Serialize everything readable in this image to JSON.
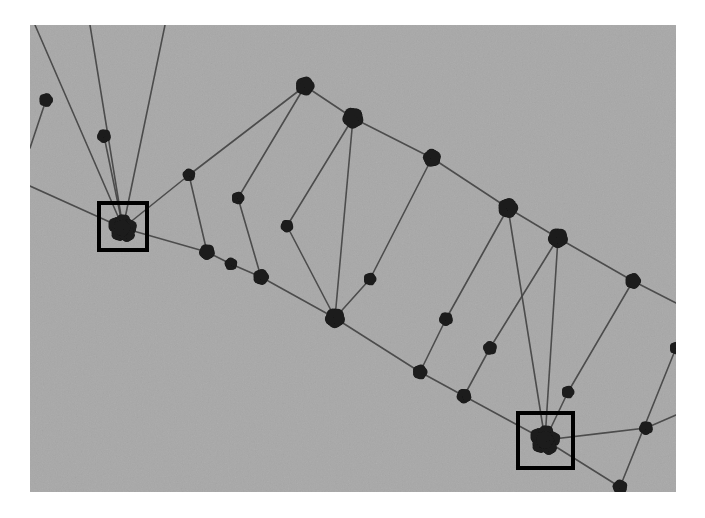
{
  "figure": {
    "domain": "diagram",
    "kind": "graph-network-diagram",
    "background_color": "#ffffff",
    "canvas_color": "#a8a8a8",
    "node_color": "#1b1b1b",
    "edge_color": "#454545",
    "box_color": "#000000",
    "canvas": {
      "x": 30,
      "y": 25,
      "width": 646,
      "height": 467
    },
    "noise": {
      "grain": true,
      "halftone": true,
      "opacity": 0.14
    }
  },
  "chart_data": {
    "type": "scatter",
    "title": "",
    "xlabel": "",
    "ylabel": "",
    "grid": false,
    "legend": null,
    "xlim": [
      30,
      676
    ],
    "ylim": [
      25,
      492
    ],
    "nodes": [
      {
        "id": "n1",
        "x": 46,
        "y": 100,
        "r": 6.5,
        "group": "upper-chain"
      },
      {
        "id": "n2",
        "x": 104,
        "y": 136,
        "r": 6.5,
        "group": "fan-left"
      },
      {
        "id": "n3",
        "x": 189,
        "y": 175,
        "r": 6.0,
        "group": "interior"
      },
      {
        "id": "n4",
        "x": 238,
        "y": 198,
        "r": 6.0,
        "group": "interior"
      },
      {
        "id": "n5",
        "x": 287,
        "y": 226,
        "r": 6.0,
        "group": "interior"
      },
      {
        "id": "n6",
        "x": 305,
        "y": 86,
        "r": 9.0,
        "group": "upper-chain"
      },
      {
        "id": "n7",
        "x": 353,
        "y": 118,
        "r": 10.0,
        "group": "upper-chain"
      },
      {
        "id": "n8",
        "x": 432,
        "y": 158,
        "r": 8.5,
        "group": "upper-chain"
      },
      {
        "id": "n9",
        "x": 508,
        "y": 208,
        "r": 9.5,
        "group": "upper-chain"
      },
      {
        "id": "n10",
        "x": 558,
        "y": 238,
        "r": 9.5,
        "group": "upper-chain"
      },
      {
        "id": "n11",
        "x": 633,
        "y": 281,
        "r": 7.5,
        "group": "upper-chain"
      },
      {
        "id": "n12",
        "x": 207,
        "y": 252,
        "r": 7.5,
        "group": "lower-chain"
      },
      {
        "id": "n13",
        "x": 231,
        "y": 264,
        "r": 6.0,
        "group": "lower-chain"
      },
      {
        "id": "n14",
        "x": 261,
        "y": 277,
        "r": 7.5,
        "group": "lower-chain"
      },
      {
        "id": "n15",
        "x": 335,
        "y": 318,
        "r": 9.5,
        "group": "lower-chain"
      },
      {
        "id": "n16",
        "x": 370,
        "y": 279,
        "r": 6.0,
        "group": "interior"
      },
      {
        "id": "n17",
        "x": 446,
        "y": 319,
        "r": 6.5,
        "group": "interior"
      },
      {
        "id": "n18",
        "x": 490,
        "y": 348,
        "r": 6.5,
        "group": "interior"
      },
      {
        "id": "n19",
        "x": 420,
        "y": 372,
        "r": 7.0,
        "group": "lower-chain"
      },
      {
        "id": "n20",
        "x": 464,
        "y": 396,
        "r": 7.0,
        "group": "lower-chain"
      },
      {
        "id": "n21",
        "x": 568,
        "y": 392,
        "r": 6.0,
        "group": "interior"
      },
      {
        "id": "n22",
        "x": 646,
        "y": 428,
        "r": 6.5,
        "group": "interior"
      },
      {
        "id": "n23",
        "x": 620,
        "y": 487,
        "r": 7.0,
        "group": "lower-chain"
      },
      {
        "id": "n24",
        "x": 676,
        "y": 348,
        "r": 6.0,
        "group": "edge-right"
      }
    ],
    "clusters": [
      {
        "id": "c1",
        "x": 123,
        "y": 228,
        "label": "left-cluster",
        "members": [
          {
            "dx": -7,
            "dy": -3,
            "r": 7.5
          },
          {
            "dx": 0,
            "dy": -6,
            "r": 7.5
          },
          {
            "dx": 6,
            "dy": -1,
            "r": 7.5
          },
          {
            "dx": -4,
            "dy": 5,
            "r": 7.5
          },
          {
            "dx": 4,
            "dy": 6,
            "r": 7.5
          },
          {
            "dx": -1,
            "dy": 0,
            "r": 8.0
          }
        ]
      },
      {
        "id": "c2",
        "x": 545,
        "y": 440,
        "label": "right-cluster",
        "members": [
          {
            "dx": -7,
            "dy": -4,
            "r": 7.5
          },
          {
            "dx": 1,
            "dy": -7,
            "r": 7.5
          },
          {
            "dx": 8,
            "dy": -1,
            "r": 7.0
          },
          {
            "dx": -5,
            "dy": 5,
            "r": 7.5
          },
          {
            "dx": 4,
            "dy": 7,
            "r": 7.5
          },
          {
            "dx": 0,
            "dy": 0,
            "r": 8.5
          }
        ]
      }
    ],
    "highlight_boxes": [
      {
        "id": "box-left",
        "label": "left-cluster-highlight",
        "x": 99,
        "y": 203,
        "width": 48,
        "height": 47,
        "stroke_width": 4
      },
      {
        "id": "box-right",
        "label": "right-cluster-highlight",
        "x": 518,
        "y": 413,
        "width": 55,
        "height": 55,
        "stroke_width": 4
      }
    ],
    "edges": [
      {
        "x1": 35,
        "y1": 25,
        "x2": 123,
        "y2": 228,
        "w": 1.6
      },
      {
        "x1": 90,
        "y1": 25,
        "x2": 123,
        "y2": 228,
        "w": 1.6
      },
      {
        "x1": 165,
        "y1": 25,
        "x2": 123,
        "y2": 228,
        "w": 1.6
      },
      {
        "x1": 30,
        "y1": 186,
        "x2": 123,
        "y2": 228,
        "w": 1.6
      },
      {
        "x1": 123,
        "y1": 228,
        "x2": 207,
        "y2": 252,
        "w": 1.6
      },
      {
        "x1": 123,
        "y1": 228,
        "x2": 189,
        "y2": 175,
        "w": 1.6
      },
      {
        "x1": 189,
        "y1": 175,
        "x2": 305,
        "y2": 86,
        "w": 1.6
      },
      {
        "x1": 238,
        "y1": 198,
        "x2": 305,
        "y2": 86,
        "w": 1.6
      },
      {
        "x1": 287,
        "y1": 226,
        "x2": 353,
        "y2": 118,
        "w": 1.6
      },
      {
        "x1": 305,
        "y1": 86,
        "x2": 353,
        "y2": 118,
        "w": 1.6
      },
      {
        "x1": 353,
        "y1": 118,
        "x2": 432,
        "y2": 158,
        "w": 1.6
      },
      {
        "x1": 432,
        "y1": 158,
        "x2": 508,
        "y2": 208,
        "w": 1.6
      },
      {
        "x1": 508,
        "y1": 208,
        "x2": 558,
        "y2": 238,
        "w": 1.6
      },
      {
        "x1": 558,
        "y1": 238,
        "x2": 633,
        "y2": 281,
        "w": 1.6
      },
      {
        "x1": 633,
        "y1": 281,
        "x2": 676,
        "y2": 303,
        "w": 1.6
      },
      {
        "x1": 207,
        "y1": 252,
        "x2": 231,
        "y2": 264,
        "w": 1.6
      },
      {
        "x1": 231,
        "y1": 264,
        "x2": 261,
        "y2": 277,
        "w": 1.6
      },
      {
        "x1": 261,
        "y1": 277,
        "x2": 335,
        "y2": 318,
        "w": 1.6
      },
      {
        "x1": 335,
        "y1": 318,
        "x2": 420,
        "y2": 372,
        "w": 1.6
      },
      {
        "x1": 420,
        "y1": 372,
        "x2": 464,
        "y2": 396,
        "w": 1.6
      },
      {
        "x1": 464,
        "y1": 396,
        "x2": 545,
        "y2": 440,
        "w": 1.6
      },
      {
        "x1": 545,
        "y1": 440,
        "x2": 620,
        "y2": 487,
        "w": 1.6
      },
      {
        "x1": 207,
        "y1": 252,
        "x2": 189,
        "y2": 175,
        "w": 1.6
      },
      {
        "x1": 261,
        "y1": 277,
        "x2": 238,
        "y2": 198,
        "w": 1.6
      },
      {
        "x1": 335,
        "y1": 318,
        "x2": 287,
        "y2": 226,
        "w": 1.6
      },
      {
        "x1": 335,
        "y1": 318,
        "x2": 353,
        "y2": 118,
        "w": 1.6
      },
      {
        "x1": 335,
        "y1": 318,
        "x2": 370,
        "y2": 279,
        "w": 1.6
      },
      {
        "x1": 370,
        "y1": 279,
        "x2": 432,
        "y2": 158,
        "w": 1.6
      },
      {
        "x1": 420,
        "y1": 372,
        "x2": 446,
        "y2": 319,
        "w": 1.6
      },
      {
        "x1": 446,
        "y1": 319,
        "x2": 508,
        "y2": 208,
        "w": 1.6
      },
      {
        "x1": 464,
        "y1": 396,
        "x2": 490,
        "y2": 348,
        "w": 1.6
      },
      {
        "x1": 490,
        "y1": 348,
        "x2": 558,
        "y2": 238,
        "w": 1.6
      },
      {
        "x1": 545,
        "y1": 440,
        "x2": 508,
        "y2": 208,
        "w": 1.6
      },
      {
        "x1": 545,
        "y1": 440,
        "x2": 558,
        "y2": 238,
        "w": 1.6
      },
      {
        "x1": 545,
        "y1": 440,
        "x2": 568,
        "y2": 392,
        "w": 1.6
      },
      {
        "x1": 568,
        "y1": 392,
        "x2": 633,
        "y2": 281,
        "w": 1.6
      },
      {
        "x1": 545,
        "y1": 440,
        "x2": 646,
        "y2": 428,
        "w": 1.6
      },
      {
        "x1": 646,
        "y1": 428,
        "x2": 676,
        "y2": 415,
        "w": 1.6
      },
      {
        "x1": 676,
        "y1": 348,
        "x2": 620,
        "y2": 487,
        "w": 1.6
      },
      {
        "x1": 46,
        "y1": 100,
        "x2": 30,
        "y2": 148,
        "w": 1.6
      },
      {
        "x1": 104,
        "y1": 136,
        "x2": 123,
        "y2": 228,
        "w": 1.6
      }
    ]
  }
}
